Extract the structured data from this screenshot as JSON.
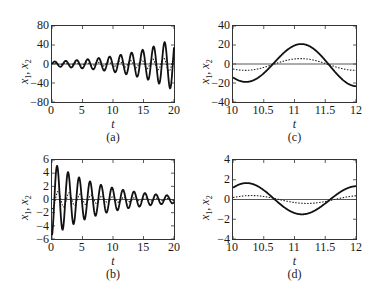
{
  "figure": {
    "panels": [
      {
        "id": "a",
        "caption": "(a)",
        "xlabel": "t",
        "ylabel_var1": "x",
        "ylabel_sub1": "1",
        "ylabel_sep": ", ",
        "ylabel_var2": "x",
        "ylabel_sub2": "2",
        "xlim": [
          0,
          20
        ],
        "ylim": [
          -80,
          80
        ],
        "xticks": [
          "0",
          "5",
          "10",
          "15",
          "20"
        ],
        "yticks": [
          "80",
          "40",
          "0",
          "−40",
          "−80"
        ],
        "frame": {
          "left": 51,
          "top": 25,
          "width": 124,
          "height": 78
        },
        "model": {
          "type": "growing",
          "omega": 3.49,
          "solid_amp0": 5,
          "solid_growth": 0.12,
          "solid_phase": 0,
          "dot_ratio": 0.3,
          "dot_phase": 0.6
        }
      },
      {
        "id": "c",
        "caption": "(c)",
        "xlabel": "t",
        "ylabel_var1": "x",
        "ylabel_sub1": "1",
        "ylabel_sep": ", ",
        "ylabel_var2": "x",
        "ylabel_sub2": "2",
        "xlim": [
          10,
          12
        ],
        "ylim": [
          -40,
          40
        ],
        "xticks": [
          "10",
          "10.5",
          "11",
          "11.5",
          "12"
        ],
        "yticks": [
          "40",
          "20",
          "0",
          "−20",
          "−40"
        ],
        "frame": {
          "left": 232,
          "top": 25,
          "width": 125,
          "height": 78
        },
        "model": {
          "type": "zoom",
          "omega": 3.49,
          "solid_amp": 21,
          "solid_growth": 0.12,
          "solid_peak": 11.1,
          "dot_amp": 6.2,
          "dot_peak": 11.1,
          "dot_offset": -0.5
        }
      },
      {
        "id": "b",
        "caption": "(b)",
        "xlabel": "t",
        "ylabel_var1": "x",
        "ylabel_sub1": "1",
        "ylabel_sep": ", ",
        "ylabel_var2": "x",
        "ylabel_sub2": "2",
        "xlim": [
          0,
          20
        ],
        "ylim": [
          -6,
          6
        ],
        "xticks": [
          "0",
          "5",
          "10",
          "15",
          "20"
        ],
        "yticks": [
          "6",
          "4",
          "2",
          "0",
          "−2",
          "−4",
          "−6"
        ],
        "frame": {
          "left": 51,
          "top": 159,
          "width": 124,
          "height": 81
        },
        "model": {
          "type": "decaying",
          "omega": 3.49,
          "solid_amp0": 5.6,
          "solid_decay": 0.115,
          "solid_phase": -1.35,
          "dot_ratio": 0.25,
          "dot_phase": -0.6
        }
      },
      {
        "id": "d",
        "caption": "(d)",
        "xlabel": "t",
        "ylabel_var1": "x",
        "ylabel_sub1": "1",
        "ylabel_sep": ", ",
        "ylabel_var2": "x",
        "ylabel_sub2": "2",
        "xlim": [
          10,
          12
        ],
        "ylim": [
          -4,
          4
        ],
        "xticks": [
          "10",
          "10.5",
          "11",
          "11.5",
          "12"
        ],
        "yticks": [
          "4",
          "2",
          "0",
          "−2",
          "−4"
        ],
        "frame": {
          "left": 232,
          "top": 159,
          "width": 125,
          "height": 81
        },
        "model": {
          "type": "zoom",
          "omega": 3.49,
          "solid_amp": -1.5,
          "solid_growth": -0.115,
          "solid_peak": 11.13,
          "dot_amp": -0.4,
          "dot_peak": 11.2,
          "dot_offset": 0
        }
      }
    ]
  },
  "chart_data": [
    {
      "type": "line",
      "panel": "a",
      "title": "",
      "xlabel": "t",
      "ylabel": "x1, x2",
      "xlim": [
        0,
        20
      ],
      "ylim": [
        -80,
        80
      ],
      "grid": false,
      "series": [
        {
          "name": "x1 (solid)",
          "style": "solid",
          "description": "oscillation with growing amplitude, ~11 cycles",
          "x": [
            0,
            2.5,
            5,
            7.5,
            10,
            12.5,
            15,
            17.5,
            20
          ],
          "envelope": [
            5,
            7,
            9,
            12,
            17,
            23,
            32,
            45,
            62
          ]
        },
        {
          "name": "x2 (dotted)",
          "style": "dotted",
          "description": "smaller in-phase-shifted oscillation, growing",
          "x": [
            0,
            5,
            10,
            15,
            20
          ],
          "envelope": [
            1.5,
            3,
            5,
            10,
            18
          ]
        },
        {
          "name": "zero line",
          "style": "thin solid",
          "x": [
            0,
            20
          ],
          "y": [
            0,
            0
          ]
        }
      ]
    },
    {
      "type": "line",
      "panel": "c",
      "title": "",
      "xlabel": "t",
      "ylabel": "x1, x2",
      "xlim": [
        10,
        12
      ],
      "ylim": [
        -40,
        40
      ],
      "grid": false,
      "series": [
        {
          "name": "x1 (solid)",
          "style": "solid",
          "x": [
            10,
            10.2,
            10.4,
            10.65,
            10.9,
            11.1,
            11.3,
            11.55,
            11.8,
            12
          ],
          "y": [
            -15,
            -19,
            -13,
            0,
            16,
            21,
            16,
            0,
            -17,
            -24
          ]
        },
        {
          "name": "x2 (dotted)",
          "style": "dotted",
          "x": [
            10,
            10.25,
            10.65,
            11.1,
            11.55,
            12
          ],
          "y": [
            -5,
            -6,
            0,
            5,
            0,
            -7
          ]
        },
        {
          "name": "zero line",
          "style": "thin solid",
          "x": [
            10,
            12
          ],
          "y": [
            0,
            0
          ]
        }
      ]
    },
    {
      "type": "line",
      "panel": "b",
      "title": "",
      "xlabel": "t",
      "ylabel": "x1, x2",
      "xlim": [
        0,
        20
      ],
      "ylim": [
        -6,
        6
      ],
      "grid": false,
      "series": [
        {
          "name": "x1 (solid)",
          "style": "solid",
          "description": "damped oscillation, ~11 cycles",
          "x": [
            0.5,
            1.3,
            2.2,
            3.1,
            4.0,
            5.0,
            6.7,
            8.5,
            10.2,
            12,
            13.8,
            15.5,
            17.3,
            19.1
          ],
          "y": [
            -5.2,
            4.7,
            -4.2,
            3.8,
            -3.3,
            3.1,
            2.5,
            2.0,
            1.6,
            1.3,
            1.0,
            0.8,
            0.7,
            0.5
          ]
        },
        {
          "name": "x2 (dotted)",
          "style": "dotted",
          "description": "small damped oscillation",
          "x": [
            0,
            5,
            10,
            15,
            20
          ],
          "envelope": [
            1.3,
            0.8,
            0.4,
            0.2,
            0.1
          ]
        },
        {
          "name": "zero line",
          "style": "thin solid",
          "x": [
            0,
            20
          ],
          "y": [
            0,
            0
          ]
        }
      ]
    },
    {
      "type": "line",
      "panel": "d",
      "title": "",
      "xlabel": "t",
      "ylabel": "x1, x2",
      "xlim": [
        10,
        12
      ],
      "ylim": [
        -4,
        4
      ],
      "grid": false,
      "series": [
        {
          "name": "x1 (solid)",
          "style": "solid",
          "x": [
            10,
            10.25,
            10.45,
            10.68,
            10.9,
            11.12,
            11.35,
            11.6,
            11.8,
            12
          ],
          "y": [
            1.0,
            1.5,
            1.1,
            0,
            -1.1,
            -1.45,
            -1.0,
            0,
            0.9,
            1.2
          ]
        },
        {
          "name": "x2 (dotted)",
          "style": "dotted",
          "x": [
            10,
            10.3,
            10.7,
            11.2,
            11.6,
            12
          ],
          "y": [
            0.2,
            0.4,
            0,
            -0.4,
            0,
            0.3
          ]
        },
        {
          "name": "zero line",
          "style": "thin solid",
          "x": [
            10,
            12
          ],
          "y": [
            0,
            0
          ]
        }
      ]
    }
  ]
}
